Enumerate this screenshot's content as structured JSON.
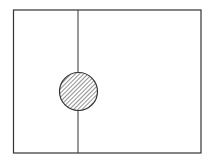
{
  "diagram": {
    "frame": {
      "x": 13.5,
      "y": 10,
      "width": 187.5,
      "height": 143,
      "stroke": "#333333",
      "stroke_width": 1.2
    },
    "divider": {
      "x": 78,
      "y1": 10,
      "y2": 153,
      "stroke": "#333333",
      "stroke_width": 1
    },
    "circle": {
      "cx": 78.5,
      "cy": 91.5,
      "r": 19,
      "fill_pattern": "diagonal-hatch",
      "hatch_color": "#555555",
      "stroke": "#333333",
      "stroke_width": 1.2
    }
  }
}
